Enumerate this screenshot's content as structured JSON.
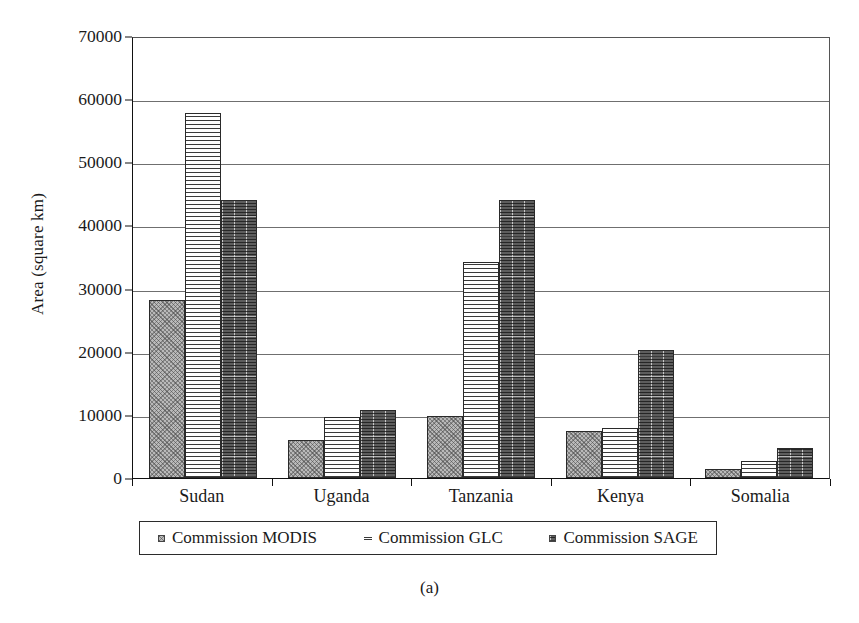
{
  "chart_data": {
    "type": "bar",
    "title": "",
    "xlabel": "",
    "ylabel": "Area (square km)",
    "categories": [
      "Sudan",
      "Uganda",
      "Tanzania",
      "Kenya",
      "Somalia"
    ],
    "series": [
      {
        "name": "Commission MODIS",
        "pattern": "light-crosshatch",
        "color": "#b9b9b9",
        "values": [
          28200,
          6000,
          9800,
          7400,
          1400
        ]
      },
      {
        "name": "Commission GLC",
        "pattern": "horizontal-lines",
        "color": "#fdfdfd",
        "values": [
          57800,
          9700,
          34200,
          8000,
          2700
        ]
      },
      {
        "name": "Commission SAGE",
        "pattern": "dark-grid",
        "color": "#5d5d5d",
        "values": [
          44000,
          10700,
          44100,
          20200,
          4800
        ]
      }
    ],
    "ylim": [
      0,
      70000
    ],
    "ytick_values": [
      0,
      10000,
      20000,
      30000,
      40000,
      50000,
      60000,
      70000
    ],
    "ytick_labels": [
      "0",
      "10000",
      "20000",
      "30000",
      "40000",
      "50000",
      "60000",
      "70000"
    ],
    "grid": true,
    "grid_axis": "y",
    "legend_position": "bottom",
    "legend": [
      "Commission MODIS",
      "Commission GLC",
      "Commission SAGE"
    ]
  },
  "caption": "(a)",
  "legend_markers": {
    "modis": "light-square-marker",
    "glc": "striped-square-marker",
    "sage": "dark-square-marker"
  }
}
